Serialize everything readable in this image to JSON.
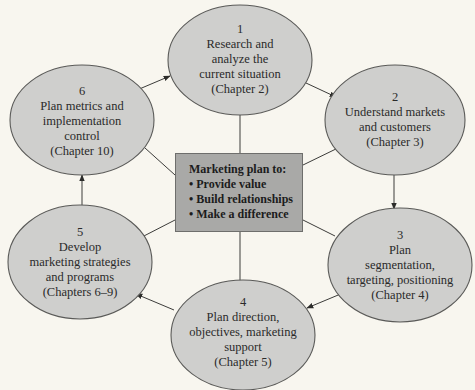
{
  "diagram": {
    "type": "cycle",
    "colors": {
      "background": "#f8f6ef",
      "ellipse_fill": "#cfcfcd",
      "ellipse_stroke": "#5a5a58",
      "center_fill": "#a9a9a7",
      "line": "#3c3c3a"
    },
    "center": {
      "title": "Marketing plan to:",
      "bullets": [
        "• Provide value",
        "• Build relationships",
        "• Make a difference"
      ]
    },
    "steps": [
      {
        "number": "1",
        "lines": [
          "Research and",
          "analyze the",
          "current situation"
        ],
        "chapter": "(Chapter 2)"
      },
      {
        "number": "2",
        "lines": [
          "Understand markets",
          "and customers"
        ],
        "chapter": "(Chapter 3)"
      },
      {
        "number": "3",
        "lines": [
          "Plan",
          "segmentation,",
          "targeting, positioning"
        ],
        "chapter": "(Chapter 4)"
      },
      {
        "number": "4",
        "lines": [
          "Plan direction,",
          "objectives, marketing",
          "support"
        ],
        "chapter": "(Chapter 5)"
      },
      {
        "number": "5",
        "lines": [
          "Develop",
          "marketing strategies",
          "and programs"
        ],
        "chapter": "(Chapters 6–9)"
      },
      {
        "number": "6",
        "lines": [
          "Plan metrics and",
          "implementation",
          "control"
        ],
        "chapter": "(Chapter 10)"
      }
    ],
    "arrows": [
      {
        "from": "1",
        "to": "2"
      },
      {
        "from": "2",
        "to": "3"
      },
      {
        "from": "3",
        "to": "4"
      },
      {
        "from": "4",
        "to": "5"
      },
      {
        "from": "5",
        "to": "6"
      },
      {
        "from": "6",
        "to": "1"
      }
    ]
  }
}
